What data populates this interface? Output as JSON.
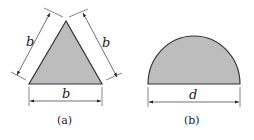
{
  "figures": [
    {
      "shape": "equilateral-triangle",
      "caption": "(a)",
      "dims": {
        "side_left": "b",
        "side_right": "b",
        "base": "b"
      }
    },
    {
      "shape": "semicircle",
      "caption": "(b)",
      "dims": {
        "diameter": "d"
      }
    }
  ],
  "colors": {
    "fill": "#bdbdbd",
    "stroke": "#333333"
  }
}
